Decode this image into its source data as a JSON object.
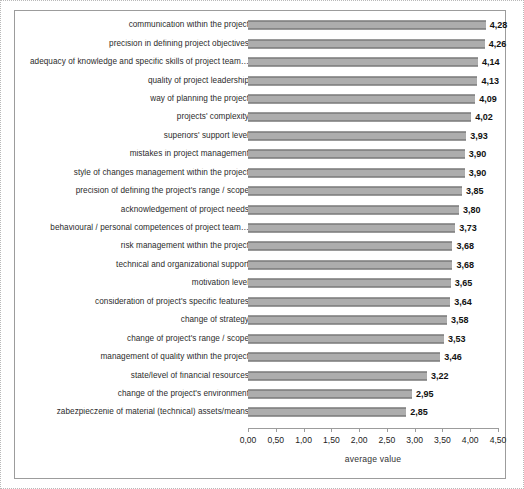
{
  "chart_data": {
    "type": "bar",
    "orientation": "horizontal",
    "title": "",
    "xlabel": "average value",
    "ylabel": "",
    "xlim": [
      0,
      4.5
    ],
    "grid": false,
    "legend": false,
    "decimal_separator": ",",
    "tick_labels": [
      "0,00",
      "0,50",
      "1,00",
      "1,50",
      "2,00",
      "2,50",
      "3,00",
      "3,50",
      "4,00",
      "4,50"
    ],
    "tick_values": [
      0,
      0.5,
      1,
      1.5,
      2,
      2.5,
      3,
      3.5,
      4,
      4.5
    ],
    "categories": [
      "communication within the project",
      "precision in defining project objectives",
      "adequacy of knowledge and specific skills of project team…",
      "quality of project leadership",
      "way of planning the project",
      "projects' complexity",
      "superiors' support level",
      "mistakes in project management",
      "style of changes management within the project",
      "precision of defining the project's range / scope",
      "acknowledgement of project needs",
      "behavioural / personal competences of project team…",
      "risk management within the project",
      "technical and organizational support",
      "motivation level",
      "consideration of project's specific features",
      "change of strategy",
      "change of project's range / scope",
      "management of quality within the project",
      "state/level of financial resources",
      "change of the project's environment",
      "zabezpieczenie of material (technical) assets/means"
    ],
    "values": [
      4.28,
      4.26,
      4.14,
      4.13,
      4.09,
      4.02,
      3.93,
      3.9,
      3.9,
      3.85,
      3.8,
      3.73,
      3.68,
      3.68,
      3.65,
      3.64,
      3.58,
      3.53,
      3.46,
      3.22,
      2.95,
      2.85
    ],
    "value_labels": [
      "4,28",
      "4,26",
      "4,14",
      "4,13",
      "4,09",
      "4,02",
      "3,93",
      "3,90",
      "3,90",
      "3,85",
      "3,80",
      "3,73",
      "3,68",
      "3,68",
      "3,65",
      "3,64",
      "3,58",
      "3,53",
      "3,46",
      "3,22",
      "2,95",
      "2,85"
    ],
    "bar_color": "#8e8e8e",
    "bar_pattern": "fine-checker-texture",
    "frame_color": "#9c9c9c"
  }
}
